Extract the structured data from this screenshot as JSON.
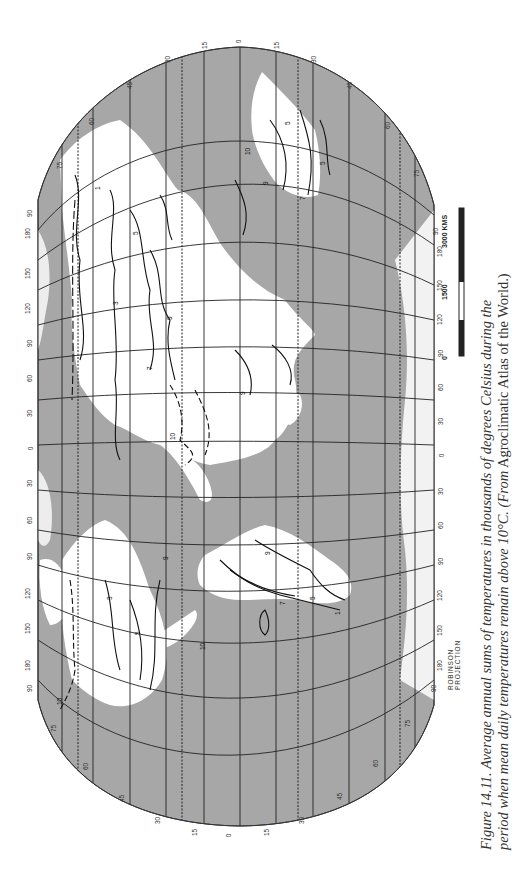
{
  "figure": {
    "number": "Figure 14.11.",
    "caption_italic_1": "Average annual sums of temperatures in thousands of degrees Celsius during the",
    "caption_italic_2": "period when mean daily temperatures remain above 10°C. (From",
    "caption_roman": "Agroclimatic Atlas of the World.)",
    "projection": "ROBINSON PROJECTION"
  },
  "scale_bar": {
    "labels": [
      "0",
      "1500",
      "3000 KMS"
    ]
  },
  "map": {
    "orientation": "rotated 90° clockwise (north at left)",
    "colors": {
      "ocean": "#a7a7a7",
      "land": "#ffffff",
      "grid": "#222222",
      "contour": "#111111"
    },
    "latitude_labels_top": [
      "75",
      "60",
      "45",
      "30",
      "15",
      "0",
      "15",
      "30",
      "45",
      "60",
      "75"
    ],
    "latitude_labels_bottom": [
      "75",
      "60",
      "45",
      "30",
      "15",
      "0",
      "15",
      "30",
      "45",
      "60",
      "75"
    ],
    "longitude_labels_left": [
      "180",
      "150",
      "120",
      "90",
      "60",
      "30",
      "0",
      "30",
      "60",
      "90",
      "120",
      "150",
      "180"
    ],
    "longitude_labels_right": [
      "180",
      "150",
      "120",
      "90",
      "60",
      "30",
      "0",
      "30",
      "60",
      "90",
      "120",
      "150",
      "180"
    ],
    "pole_labels": [
      "90",
      "90",
      "90",
      "90"
    ],
    "contour_values": [
      "1",
      "3",
      "5",
      "7",
      "9",
      "10"
    ],
    "contour_labels_sample": [
      "1",
      "3",
      "5",
      "7",
      "9",
      "10",
      "10",
      "9",
      "7",
      "5",
      "3",
      "1"
    ]
  }
}
